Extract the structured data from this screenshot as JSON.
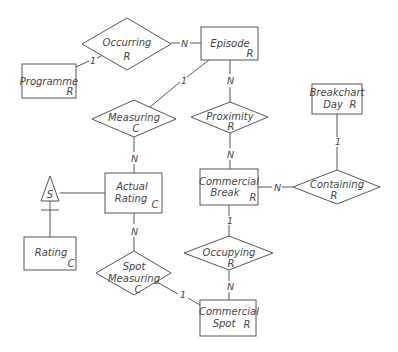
{
  "diagram": {
    "type": "entity-relationship",
    "entities": [
      {
        "id": "episode",
        "name": "Episode",
        "type_tag": "R"
      },
      {
        "id": "programme",
        "name": "Programme",
        "type_tag": "R"
      },
      {
        "id": "breakchart_day",
        "name_line1": "Breakchart",
        "name_line2": "Day",
        "type_tag": "R"
      },
      {
        "id": "actual_rating",
        "name_line1": "Actual",
        "name_line2": "Rating",
        "type_tag": "C"
      },
      {
        "id": "commercial_break",
        "name_line1": "Commercial",
        "name_line2": "Break",
        "type_tag": "R"
      },
      {
        "id": "rating",
        "name": "Rating",
        "type_tag": "C"
      },
      {
        "id": "commercial_spot",
        "name_line1": "Commercial",
        "name_line2": "Spot",
        "type_tag": "R"
      }
    ],
    "relationships": [
      {
        "id": "occurring",
        "name": "Occurring",
        "type_tag": "R"
      },
      {
        "id": "measuring",
        "name": "Measuring",
        "type_tag": "C"
      },
      {
        "id": "proximity",
        "name": "Proximity",
        "type_tag": "R"
      },
      {
        "id": "containing",
        "name": "Containing",
        "type_tag": "R"
      },
      {
        "id": "occupying",
        "name": "Occupying",
        "type_tag": "R"
      },
      {
        "id": "spot_measuring",
        "name_line1": "Spot",
        "name_line2": "Measuring",
        "type_tag": "C"
      }
    ],
    "subtype": {
      "symbol": "S",
      "supertype": "actual_rating",
      "subtype": "rating"
    },
    "connections": [
      {
        "from": "programme",
        "to": "occurring",
        "cardinality": "1"
      },
      {
        "from": "occurring",
        "to": "episode",
        "cardinality": "N"
      },
      {
        "from": "episode",
        "to": "measuring",
        "cardinality": "1"
      },
      {
        "from": "episode",
        "to": "proximity",
        "cardinality": "N"
      },
      {
        "from": "measuring",
        "to": "actual_rating",
        "cardinality": "N"
      },
      {
        "from": "proximity",
        "to": "commercial_break",
        "cardinality": "N"
      },
      {
        "from": "breakchart_day",
        "to": "containing",
        "cardinality": "1"
      },
      {
        "from": "commercial_break",
        "to": "containing",
        "cardinality": "N"
      },
      {
        "from": "commercial_break",
        "to": "occupying",
        "cardinality": "1"
      },
      {
        "from": "occupying",
        "to": "commercial_spot",
        "cardinality": "N"
      },
      {
        "from": "actual_rating",
        "to": "spot_measuring",
        "cardinality": "N"
      },
      {
        "from": "spot_measuring",
        "to": "commercial_spot",
        "cardinality": "1"
      }
    ],
    "cardinality_labels": {
      "programme_occurring": "1",
      "occurring_episode": "N",
      "episode_measuring": "1",
      "episode_proximity": "N",
      "measuring_actual_rating": "N",
      "proximity_commercial_break": "N",
      "breakchart_containing": "1",
      "commercial_break_containing": "N",
      "commercial_break_occupying": "1",
      "occupying_commercial_spot": "N",
      "actual_rating_spot_measuring": "N",
      "spot_measuring_commercial_spot": "1"
    }
  }
}
